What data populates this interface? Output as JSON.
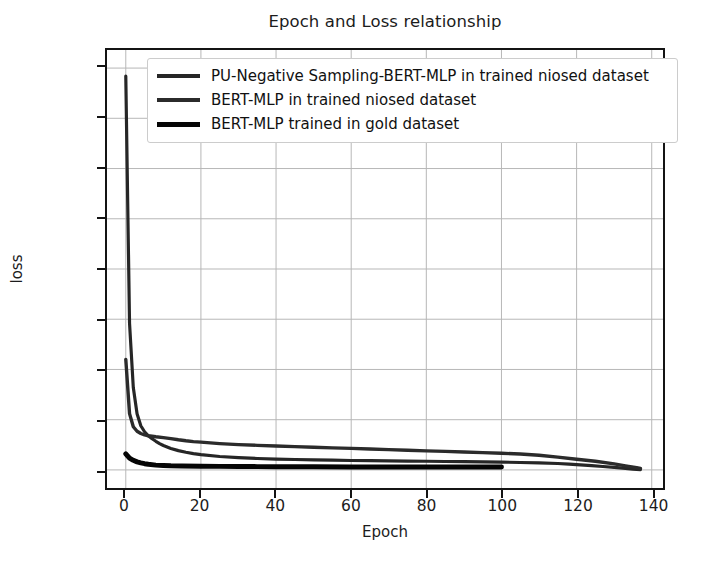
{
  "chart_data": {
    "type": "line",
    "title": "Epoch and Loss relationship",
    "xlabel": "Epoch",
    "ylabel": "loss",
    "xlim": [
      -5,
      143
    ],
    "ylim": [
      -180,
      4180
    ],
    "xticks": [
      0,
      20,
      40,
      60,
      80,
      100,
      120,
      140
    ],
    "yticks": [
      0,
      500,
      1000,
      1500,
      2000,
      2500,
      3000,
      3500,
      4000
    ],
    "grid": true,
    "legend_position": "upper center",
    "series": [
      {
        "name": "PU-Negative Sampling-BERT-MLP in trained niosed dataset",
        "color": "#262626",
        "linewidth": 3.2,
        "x": [
          0,
          1,
          2,
          3,
          4,
          5,
          6,
          7,
          8,
          9,
          10,
          12,
          14,
          16,
          18,
          20,
          25,
          30,
          35,
          40,
          45,
          50,
          55,
          60,
          65,
          70,
          75,
          80,
          85,
          90,
          95,
          100,
          105,
          110,
          115,
          118,
          121,
          124,
          127,
          130,
          133,
          135,
          137
        ],
        "y": [
          3920,
          1460,
          820,
          560,
          440,
          380,
          340,
          310,
          285,
          262,
          243,
          214,
          192,
          176,
          162,
          152,
          134,
          122,
          114,
          108,
          104,
          100,
          97,
          94,
          92,
          90,
          88,
          86,
          84,
          82,
          80,
          78,
          74,
          70,
          64,
          58,
          50,
          42,
          34,
          26,
          16,
          8,
          2
        ]
      },
      {
        "name": "BERT-MLP in trained niosed dataset",
        "color": "#2b2b2b",
        "linewidth": 3.4,
        "x": [
          0,
          1,
          2,
          3,
          4,
          5,
          6,
          8,
          10,
          12,
          14,
          16,
          18,
          20,
          25,
          30,
          35,
          40,
          45,
          50,
          55,
          60,
          65,
          70,
          75,
          80,
          85,
          90,
          95,
          100,
          105,
          110,
          115,
          120,
          125,
          130,
          133,
          136,
          137
        ],
        "y": [
          1100,
          560,
          430,
          385,
          362,
          348,
          340,
          330,
          322,
          312,
          300,
          290,
          282,
          276,
          262,
          252,
          245,
          238,
          232,
          226,
          220,
          214,
          208,
          202,
          196,
          190,
          184,
          178,
          172,
          166,
          158,
          146,
          128,
          106,
          86,
          60,
          40,
          22,
          14
        ]
      },
      {
        "name": "BERT-MLP trained in gold dataset",
        "color": "#050505",
        "linewidth": 5.0,
        "x": [
          0,
          1,
          2,
          3,
          4,
          5,
          6,
          8,
          10,
          12,
          15,
          20,
          25,
          30,
          35,
          40,
          50,
          60,
          70,
          80,
          90,
          100
        ],
        "y": [
          160,
          118,
          96,
          80,
          70,
          62,
          56,
          48,
          44,
          41,
          39,
          37,
          35,
          34,
          33,
          32,
          31,
          30,
          30,
          29,
          29,
          28
        ]
      }
    ]
  },
  "axes": {
    "title": "Epoch and Loss relationship",
    "x_label": "Epoch",
    "y_label": "loss",
    "x_tick_labels": [
      "0",
      "20",
      "40",
      "60",
      "80",
      "100",
      "120",
      "140"
    ],
    "y_tick_labels": [
      "0",
      "500",
      "1000",
      "1500",
      "2000",
      "2500",
      "3000",
      "3500",
      "4000"
    ]
  },
  "legend": {
    "entries": [
      {
        "label": "PU-Negative Sampling-BERT-MLP in trained niosed dataset"
      },
      {
        "label": "BERT-MLP in trained niosed dataset"
      },
      {
        "label": "BERT-MLP trained in gold dataset"
      }
    ]
  },
  "style": {
    "background": "#ffffff",
    "grid_color": "#b6b6b6",
    "axis_color": "#141414",
    "text_color": "#1c1c1c",
    "legend_border": "#cccccc"
  }
}
